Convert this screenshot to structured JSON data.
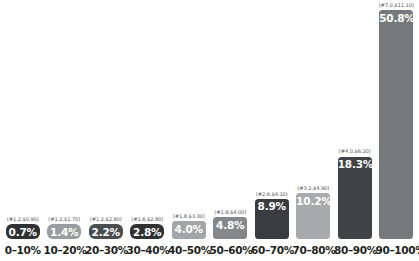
{
  "chart_data": {
    "type": "bar",
    "title": "",
    "subtitle": "",
    "xlabel": "",
    "ylabel": "",
    "ylim": [
      0,
      50.8
    ],
    "grid": false,
    "legend": "none",
    "value_suffix": "%",
    "categories": [
      "0–10%",
      "10–20%",
      "20–30%",
      "30–40%",
      "40–50%",
      "50–60%",
      "60–70%",
      "70–80%",
      "80–90%",
      "90–100%"
    ],
    "values": [
      0.7,
      1.4,
      2.2,
      2.8,
      4.0,
      4.8,
      8.9,
      10.2,
      18.3,
      50.8
    ],
    "value_labels": [
      "0.7%",
      "1.4%",
      "2.2%",
      "2.8%",
      "4.0%",
      "4.8%",
      "8.9%",
      "10.2%",
      "18.3%",
      "50.8%"
    ],
    "annotations": [
      "(#1.2,$0.90)",
      "(#1.2,$1.70)",
      "(#1.2,$2.80)",
      "(#1.6,$2.80)",
      "(#1.8,$3.30)",
      "(#1.8,$4.00)",
      "(#2.6,$4.10)",
      "(#3.2,$4.90)",
      "(#4.0,$6.20)",
      "(#7.0,$11.10)"
    ],
    "annotation_counts": [
      1.2,
      1.2,
      1.2,
      1.6,
      1.8,
      1.8,
      2.6,
      3.2,
      4.0,
      7.0
    ],
    "annotation_amounts": [
      0.9,
      1.7,
      2.8,
      2.8,
      3.3,
      4.0,
      4.1,
      4.9,
      6.2,
      11.1
    ],
    "bar_colors": [
      "#2f3133",
      "#9a9da0",
      "#4b4e51",
      "#2f3133",
      "#a3a6a9",
      "#85888b",
      "#3a3c3f",
      "#a8abae",
      "#404346",
      "#76797c"
    ],
    "background_color": "#ffffff",
    "label_text_color": "#ffffff",
    "annotation_text_color": "#55585c",
    "axis_text_color": "#231f20"
  }
}
